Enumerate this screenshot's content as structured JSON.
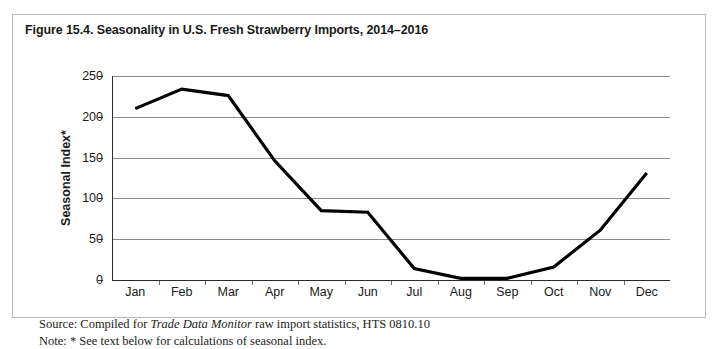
{
  "figure": {
    "title": "Figure 15.4. Seasonality in U.S. Fresh Strawberry Imports, 2014–2016",
    "source_prefix": "Source: Compiled for ",
    "source_italic": "Trade Data Monitor",
    "source_suffix": " raw import statistics, HTS 0810.10",
    "note": "Note: * See text below for calculations of seasonal index.",
    "border_color": "#b9b9b9",
    "background": "#ffffff"
  },
  "chart_data": {
    "type": "line",
    "title": "Figure 15.4. Seasonality in U.S. Fresh Strawberry Imports, 2014–2016",
    "xlabel": "",
    "ylabel": "Seasonal Index*",
    "categories": [
      "Jan",
      "Feb",
      "Mar",
      "Apr",
      "May",
      "Jun",
      "Jul",
      "Aug",
      "Sep",
      "Oct",
      "Nov",
      "Dec"
    ],
    "values": [
      210,
      234,
      226,
      146,
      85,
      83,
      14,
      2,
      2,
      16,
      61,
      131
    ],
    "series": [
      {
        "name": "Seasonal Index",
        "values": [
          210,
          234,
          226,
          146,
          85,
          83,
          14,
          2,
          2,
          16,
          61,
          131
        ],
        "color": "#000000"
      }
    ],
    "ylim": [
      0,
      250
    ],
    "yticks": [
      0,
      50,
      100,
      150,
      200,
      250
    ],
    "ytick_labels": [
      "0",
      "50",
      "100",
      "150",
      "200",
      "250"
    ],
    "grid": "horizontal",
    "legend": "none",
    "line_color": "#000000",
    "gridline_color": "#8d8d8d"
  }
}
